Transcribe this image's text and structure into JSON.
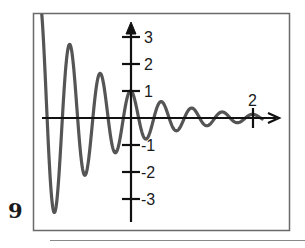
{
  "figure": {
    "label": "9"
  },
  "colors": {
    "frame": "#6a6a6a",
    "axes": "#111111",
    "curve": "#555555",
    "footer_line": "#888888"
  },
  "chart_data": {
    "type": "line",
    "title": "",
    "xlabel": "",
    "ylabel": "",
    "function": "y = e^(-x) * cos(4*pi*x)",
    "xlim": [
      -1.5,
      2.5
    ],
    "ylim": [
      -3.5,
      3.8
    ],
    "grid": false,
    "legend": null,
    "x_ticks": [
      {
        "value": 2,
        "label": "2"
      }
    ],
    "y_ticks": [
      {
        "value": 3,
        "label": "3"
      },
      {
        "value": 2,
        "label": "2"
      },
      {
        "value": 1,
        "label": "1"
      },
      {
        "value": -1,
        "label": "-1"
      },
      {
        "value": -2,
        "label": "-2"
      },
      {
        "value": -3,
        "label": "-3"
      }
    ],
    "series": [
      {
        "name": "damped oscillation",
        "x": [
          -1.5,
          -1.25,
          -1.0,
          -0.75,
          -0.5,
          -0.25,
          0.0,
          0.25,
          0.5,
          0.75,
          1.0,
          1.25,
          1.5,
          1.75,
          2.0
        ],
        "y": [
          4.48,
          -3.49,
          2.72,
          -2.12,
          1.65,
          -1.28,
          1.0,
          -0.78,
          0.61,
          -0.47,
          0.37,
          -0.29,
          0.22,
          -0.17,
          0.14
        ]
      }
    ]
  }
}
